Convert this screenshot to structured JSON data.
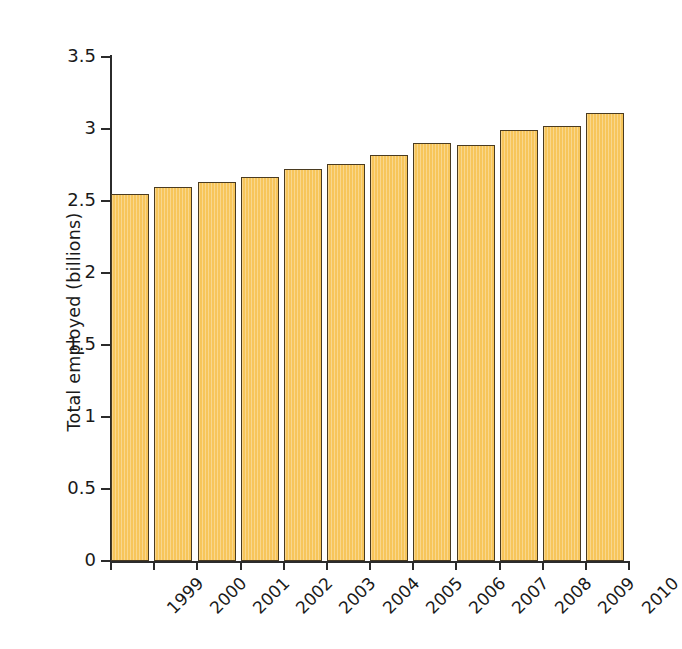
{
  "chart_data": {
    "type": "bar",
    "title": "",
    "subtitle": "",
    "xlabel": "",
    "ylabel": "Total employed (billions)",
    "categories": [
      "1999",
      "2000",
      "2001",
      "2002",
      "2003",
      "2004",
      "2005",
      "2006",
      "2007",
      "2008",
      "2009",
      "2010"
    ],
    "values": [
      2.55,
      2.6,
      2.63,
      2.67,
      2.72,
      2.76,
      2.82,
      2.9,
      2.89,
      2.99,
      3.02,
      3.11
    ],
    "series": [
      {
        "name": "Total employed",
        "values": [
          2.55,
          2.6,
          2.63,
          2.67,
          2.72,
          2.76,
          2.82,
          2.9,
          2.89,
          2.99,
          3.02,
          3.11
        ]
      }
    ],
    "ylim": [
      0,
      3.5
    ],
    "ytick_values": [
      0,
      0.5,
      1,
      1.5,
      2,
      2.5,
      3,
      3.5
    ],
    "ytick_labels": [
      "0",
      "0.5",
      "1",
      "1.5",
      "2",
      "2.5",
      "3",
      "3.5"
    ],
    "grid": false,
    "legend": false,
    "legend_position": "none",
    "xtick_label_rotation": -45,
    "bar_fill_color": "#F7C65C",
    "bar_border_color": "#4A3B20",
    "axis_color": "#2B2B2B",
    "background_color": "#FFFFFF"
  }
}
